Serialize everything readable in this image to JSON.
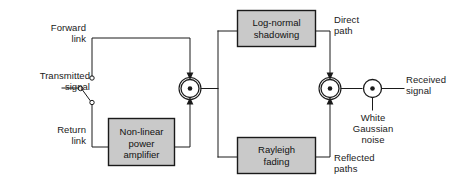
{
  "diagram": {
    "colors": {
      "block_fill": "#c9c9c9",
      "line": "#1a1a1a",
      "background": "#ffffff",
      "text": "#1a1a1a"
    },
    "blocks": [
      {
        "id": "nonlinear-power-amplifier",
        "label": "Non-linear\npower\namplifier"
      },
      {
        "id": "log-normal-shadowing",
        "label": "Log-normal\nshadowing"
      },
      {
        "id": "rayleigh-fading",
        "label": "Rayleigh\nfading"
      }
    ],
    "labels": {
      "forward_link": "Forward\nlink",
      "return_link": "Return\nlink",
      "transmitted_signal": "Transmitted\nsignal",
      "direct_path": "Direct\npath",
      "reflected_paths": "Reflected\npaths",
      "white_gaussian_noise": "White\nGaussian\nnoise",
      "received_signal": "Received\nsignal"
    },
    "nodes": [
      {
        "id": "uplink-mixer",
        "symbol": "multiplier"
      },
      {
        "id": "path-combiner",
        "symbol": "multiplier"
      },
      {
        "id": "noise-adder",
        "symbol": "multiplier"
      }
    ],
    "switch": {
      "id": "link-selector-switch",
      "position": "return-link",
      "contacts": [
        "forward-link",
        "return-link"
      ]
    }
  }
}
